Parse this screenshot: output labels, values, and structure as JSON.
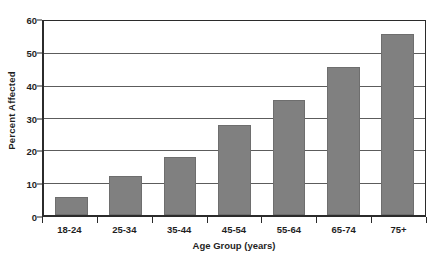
{
  "chart_data": {
    "type": "bar",
    "title": "",
    "subtitle": "",
    "xlabel": "Age Group (years)",
    "ylabel": "Percent Affected",
    "categories": [
      "18-24",
      "25-34",
      "35-44",
      "45-54",
      "55-64",
      "65-74",
      "75+"
    ],
    "values": [
      5.5,
      12,
      17.8,
      27.3,
      35,
      45,
      55
    ],
    "series": [
      {
        "name": "Percent Affected",
        "values": [
          5.5,
          12,
          17.8,
          27.3,
          35,
          45,
          55
        ]
      }
    ],
    "ylim": [
      0,
      60
    ],
    "yticks": [
      0,
      10,
      20,
      30,
      40,
      50,
      60
    ],
    "ytick_labels": [
      "0",
      "10",
      "20",
      "30",
      "40",
      "50",
      "60"
    ],
    "grid": true,
    "grid_axis": "y",
    "legend": false,
    "legend_position": "none",
    "annotations": [],
    "bar_color": "#808080",
    "bar_edge_color": "#6e6e6e",
    "gridline_color": "#5c5c5c",
    "axis_color": "#2b2b2b",
    "background_color": "#ffffff",
    "text_color": "#1f1f1f"
  }
}
